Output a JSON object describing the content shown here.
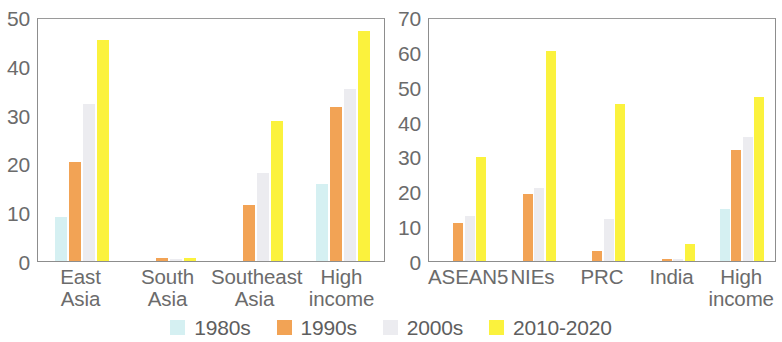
{
  "chart_data": [
    {
      "type": "bar",
      "panel": "left",
      "title": "",
      "xlabel": "",
      "ylabel": "",
      "ylim": [
        0,
        50
      ],
      "yticks": [
        0,
        10,
        20,
        30,
        40,
        50
      ],
      "grid": false,
      "legend_position": "bottom",
      "categories": [
        "East Asia",
        "South Asia",
        "Southeast Asia",
        "High income"
      ],
      "category_lines": [
        [
          "East",
          "Asia"
        ],
        [
          "South",
          "Asia"
        ],
        [
          "Southeast",
          "Asia"
        ],
        [
          "High",
          "income"
        ]
      ],
      "series": [
        {
          "name": "1980s",
          "color": "#d5f0f2",
          "values": [
            9.0,
            0.0,
            0.0,
            15.8
          ]
        },
        {
          "name": "1990s",
          "color": "#f2a355",
          "values": [
            20.2,
            0.6,
            11.5,
            31.5
          ]
        },
        {
          "name": "2000s",
          "color": "#ececf0",
          "values": [
            32.2,
            0.5,
            18.0,
            35.2
          ]
        },
        {
          "name": "2010-2020",
          "color": "#fbf23d",
          "values": [
            45.2,
            0.7,
            28.6,
            47.2
          ]
        }
      ]
    },
    {
      "type": "bar",
      "panel": "right",
      "title": "",
      "xlabel": "",
      "ylabel": "",
      "ylim": [
        0,
        70
      ],
      "yticks": [
        0,
        10,
        20,
        30,
        40,
        50,
        60,
        70
      ],
      "grid": false,
      "legend_position": "bottom",
      "categories": [
        "ASEAN5",
        "NIEs",
        "PRC",
        "India",
        "High income"
      ],
      "category_lines": [
        [
          "ASEAN5",
          ""
        ],
        [
          "NIEs",
          ""
        ],
        [
          "PRC",
          ""
        ],
        [
          "India",
          ""
        ],
        [
          "High",
          "income"
        ]
      ],
      "series": [
        {
          "name": "1980s",
          "color": "#d5f0f2",
          "values": [
            0.0,
            0.0,
            0.0,
            0.0,
            14.8
          ]
        },
        {
          "name": "1990s",
          "color": "#f2a355",
          "values": [
            11.0,
            19.3,
            3.0,
            0.5,
            31.8
          ]
        },
        {
          "name": "2000s",
          "color": "#ececf0",
          "values": [
            13.0,
            21.0,
            12.0,
            0.5,
            35.5
          ]
        },
        {
          "name": "2010-2020",
          "color": "#fbf23d",
          "values": [
            29.8,
            60.3,
            45.0,
            5.0,
            47.0
          ]
        }
      ]
    }
  ],
  "legend": {
    "entries": [
      {
        "label": "1980s",
        "color": "#d5f0f2"
      },
      {
        "label": "1990s",
        "color": "#f2a355"
      },
      {
        "label": "2000s",
        "color": "#ececf0"
      },
      {
        "label": "2010-2020",
        "color": "#fbf23d"
      }
    ]
  },
  "colors": {
    "axis": "#8d8d8d",
    "text": "#6b6b6b",
    "background": "#ffffff",
    "series_1980s": "#d5f0f2",
    "series_1990s": "#f2a355",
    "series_2000s": "#ececf0",
    "series_2010_2020": "#fbf23d"
  }
}
